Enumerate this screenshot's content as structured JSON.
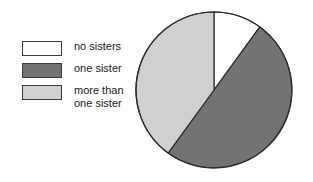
{
  "figure": {
    "background": "#ffffff",
    "width": 313,
    "height": 182
  },
  "legend": {
    "items": [
      {
        "label": "no sisters",
        "swatch_color": "#ffffff",
        "swatch_border": "#3a3a3a"
      },
      {
        "label": "one sister",
        "swatch_color": "#737373",
        "swatch_border": "#3a3a3a"
      },
      {
        "label": "more than\none sister",
        "swatch_color": "#d0d0d0",
        "swatch_border": "#3a3a3a"
      }
    ]
  },
  "pie": {
    "center_x": 214,
    "center_y": 90,
    "radius": 78,
    "outline_color": "#2b2b2b"
  },
  "chart_data": {
    "type": "pie",
    "title": "",
    "categories": [
      "no sisters",
      "one sister",
      "more than one sister"
    ],
    "values": [
      10,
      50,
      40
    ],
    "unit": "percent",
    "colors": [
      "#ffffff",
      "#737373",
      "#d0d0d0"
    ],
    "start_angle_deg": 0,
    "direction": "clockwise",
    "slice_angles_deg": [
      36,
      180,
      144
    ],
    "legend_position": "left",
    "grid": false,
    "xlabel": "",
    "ylabel": ""
  }
}
